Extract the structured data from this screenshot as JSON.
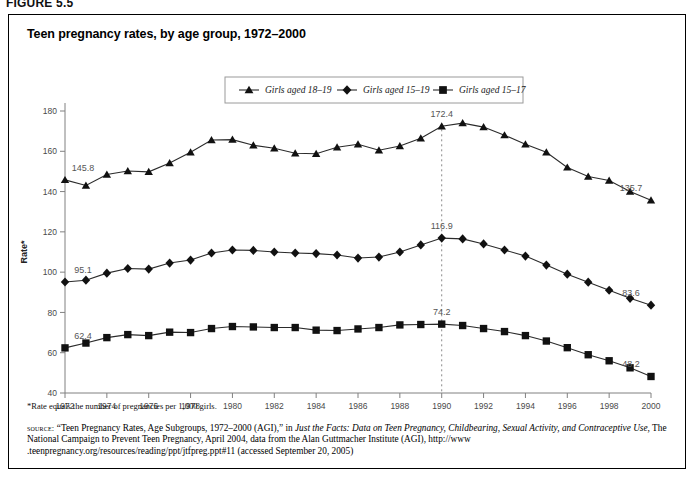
{
  "figure": {
    "label": "FIGURE 5.5",
    "title": "Teen pregnancy rates, by age group, 1972–2000"
  },
  "footnote": "*Rate equals the number of pregnancies per 1,000 girls.",
  "source": {
    "keyword": "source:",
    "part1": " “Teen Pregnancy Rates, Age Subgroups, 1972–2000 (AGI),” in ",
    "italic1": "Just the Facts: Data on Teen Pregnancy, Childbearing, Sexual Activity, and Contraceptive Use,",
    "part2": " The National Campaign to Prevent Teen Pregnancy, April 2004, data from the Alan Guttmacher Institute (AGI), http://www .teenpregnancy.org/resources/reading/ppt/jtfpreg.ppt#11 (accessed September 20, 2005)"
  },
  "legend": {
    "items": [
      {
        "label": "Girls aged 18–19",
        "marker": "triangle"
      },
      {
        "label": "Girls aged 15–19",
        "marker": "diamond"
      },
      {
        "label": "Girls aged 15–17",
        "marker": "square"
      }
    ]
  },
  "chart_data": {
    "type": "line",
    "title": "Teen pregnancy rates, by age group, 1972–2000",
    "xlabel": "",
    "ylabel": "Rate*",
    "xlim": [
      1972,
      2000
    ],
    "ylim": [
      40,
      180
    ],
    "yticks": [
      40,
      60,
      80,
      100,
      120,
      140,
      160,
      180
    ],
    "xticks": [
      1972,
      1974,
      1976,
      1978,
      1980,
      1982,
      1984,
      1986,
      1988,
      1990,
      1992,
      1994,
      1996,
      1998,
      2000
    ],
    "grid": false,
    "legend_position": "top-center",
    "x": [
      1972,
      1973,
      1974,
      1975,
      1976,
      1977,
      1978,
      1979,
      1980,
      1981,
      1982,
      1983,
      1984,
      1985,
      1986,
      1987,
      1988,
      1989,
      1990,
      1991,
      1992,
      1993,
      1994,
      1995,
      1996,
      1997,
      1998,
      1999,
      2000
    ],
    "series": [
      {
        "name": "Girls aged 18–19",
        "marker": "triangle",
        "values": [
          145.8,
          143.0,
          148.5,
          150.2,
          149.8,
          154.2,
          159.5,
          165.6,
          165.8,
          163.0,
          161.5,
          159.0,
          158.8,
          162.0,
          163.5,
          160.5,
          162.6,
          166.5,
          172.4,
          174.0,
          172.0,
          168.0,
          163.5,
          159.5,
          152.0,
          147.5,
          145.5,
          140.0,
          135.7
        ]
      },
      {
        "name": "Girls aged 15–19",
        "marker": "diamond",
        "values": [
          95.1,
          96.0,
          99.5,
          101.8,
          101.5,
          104.5,
          106.0,
          109.5,
          111.0,
          110.8,
          110.0,
          109.5,
          109.2,
          108.5,
          107.0,
          107.5,
          110.0,
          113.5,
          116.9,
          116.5,
          114.0,
          111.0,
          108.0,
          103.5,
          99.0,
          95.0,
          91.0,
          87.0,
          83.6
        ]
      },
      {
        "name": "Girls aged 15–17",
        "marker": "square",
        "values": [
          62.4,
          64.8,
          67.5,
          69.0,
          68.5,
          70.2,
          70.0,
          72.0,
          73.0,
          72.8,
          72.5,
          72.5,
          71.2,
          71.0,
          71.8,
          72.5,
          73.8,
          74.0,
          74.2,
          73.5,
          72.0,
          70.5,
          68.5,
          65.8,
          62.5,
          59.0,
          56.0,
          52.5,
          48.2
        ]
      }
    ],
    "annotations": [
      {
        "x": 1972,
        "y": 145.8,
        "text": "145.8",
        "series": "Girls aged 18–19"
      },
      {
        "x": 1972,
        "y": 95.1,
        "text": "95.1",
        "series": "Girls aged 15–19"
      },
      {
        "x": 1972,
        "y": 62.4,
        "text": "62.4",
        "series": "Girls aged 15–17"
      },
      {
        "x": 1990,
        "y": 172.4,
        "text": "172.4",
        "series": "Girls aged 18–19"
      },
      {
        "x": 1990,
        "y": 116.9,
        "text": "116.9",
        "series": "Girls aged 15–19"
      },
      {
        "x": 1990,
        "y": 74.2,
        "text": "74.2",
        "series": "Girls aged 15–17"
      },
      {
        "x": 2000,
        "y": 135.7,
        "text": "135.7",
        "series": "Girls aged 18–19"
      },
      {
        "x": 2000,
        "y": 83.6,
        "text": "83.6",
        "series": "Girls aged 15–19"
      },
      {
        "x": 2000,
        "y": 48.2,
        "text": "48.2",
        "series": "Girls aged 15–17"
      }
    ],
    "reference_line": {
      "x": 1990,
      "style": "dashed"
    }
  }
}
